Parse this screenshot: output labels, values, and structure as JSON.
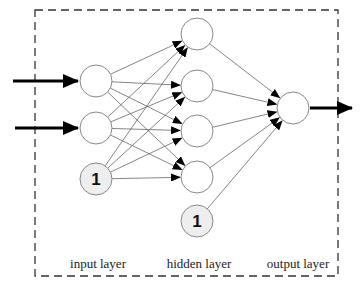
{
  "diagram": {
    "colors": {
      "node_stroke": "#888888",
      "node_fill": "#ffffff",
      "bias_fill": "#eeeeee",
      "edge": "#666666",
      "io_arrow": "#000000",
      "box": "#333333"
    },
    "layers": {
      "input": {
        "label": "input layer",
        "nodes": [
          {
            "id": "i1",
            "x": 96,
            "y": 81,
            "bias": false
          },
          {
            "id": "i2",
            "x": 96,
            "y": 128,
            "bias": false
          },
          {
            "id": "ib",
            "x": 96,
            "y": 179,
            "bias": true,
            "text": "1"
          }
        ]
      },
      "hidden": {
        "label": "hidden layer",
        "nodes": [
          {
            "id": "h1",
            "x": 197,
            "y": 34,
            "bias": false
          },
          {
            "id": "h2",
            "x": 197,
            "y": 86,
            "bias": false
          },
          {
            "id": "h3",
            "x": 197,
            "y": 131,
            "bias": false
          },
          {
            "id": "h4",
            "x": 197,
            "y": 177,
            "bias": false
          },
          {
            "id": "hb",
            "x": 197,
            "y": 221,
            "bias": true,
            "text": "1"
          }
        ]
      },
      "output": {
        "label": "output layer",
        "nodes": [
          {
            "id": "o1",
            "x": 293,
            "y": 108,
            "bias": false
          }
        ]
      }
    },
    "label_positions": {
      "input": {
        "x": 98,
        "y": 268
      },
      "hidden": {
        "x": 199,
        "y": 268
      },
      "output": {
        "x": 298,
        "y": 268
      }
    },
    "node_radius": 16,
    "box": {
      "x": 35,
      "y": 10,
      "w": 303,
      "h": 266
    },
    "input_arrows": [
      {
        "x1": 13,
        "y1": 81,
        "x2": 78,
        "y2": 81
      },
      {
        "x1": 15,
        "y1": 128,
        "x2": 78,
        "y2": 128
      }
    ],
    "output_arrow": {
      "x1": 310,
      "y1": 108,
      "x2": 352,
      "y2": 108
    }
  }
}
